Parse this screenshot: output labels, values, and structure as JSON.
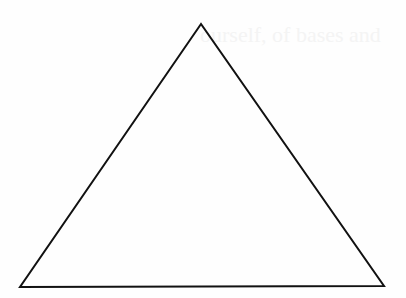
{
  "figure": {
    "shape": "triangle",
    "kind": "equilateral-like outline",
    "vertices": {
      "apex": [
        201,
        24
      ],
      "bottom_left": [
        20,
        287
      ],
      "bottom_right": [
        384,
        286
      ]
    },
    "stroke_color": "#111111",
    "stroke_width": 2,
    "fill": "none",
    "background_color": "#fefefe"
  },
  "background": {
    "show_through_text": "ourself, of bases and"
  }
}
